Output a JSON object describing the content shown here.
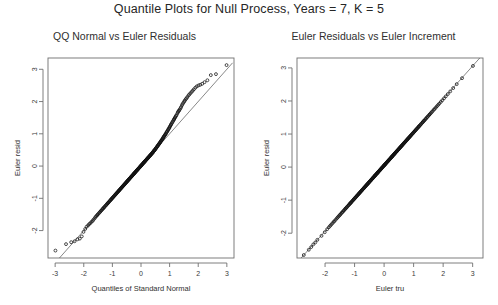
{
  "figure": {
    "title": "Quantile Plots for Null Process, Years = 7, K = 5",
    "background": "#ffffff",
    "point_color": "#111111",
    "line_color": "#555555",
    "axis_color": "#6f6f6f"
  },
  "panels": {
    "left": {
      "title": "QQ Normal vs Euler Residuals"
    },
    "right": {
      "title": "Euler Residuals vs Euler Increment"
    }
  },
  "chart_data": [
    {
      "type": "scatter",
      "title": "QQ Normal vs Euler Residuals",
      "xlabel": "Quantiles of Standard Normal",
      "ylabel": "Euler resid",
      "xlim": [
        -3.25,
        3.25
      ],
      "ylim": [
        -2.85,
        3.35
      ],
      "grid": false,
      "legend": null,
      "xticks": [
        -3,
        -2,
        -1,
        0,
        1,
        2,
        3
      ],
      "yticks": [
        -2,
        -1,
        0,
        1,
        2,
        3
      ],
      "xticklabels": [
        "-3",
        "-2",
        "-1",
        "0",
        "1",
        "2",
        "3"
      ],
      "yticklabels": [
        "-2",
        "-1",
        "0",
        "1",
        "2",
        "3"
      ],
      "reference_line": {
        "slope": 1.0,
        "intercept": 0.0,
        "x_from": -3.1,
        "x_to": 3.2
      },
      "marker": "open-circle",
      "n_points": 300,
      "x": [
        -2.99,
        -2.62,
        -2.44,
        -2.32,
        -2.22,
        -2.14,
        -2.07,
        -2.01,
        -1.95,
        -1.9,
        -1.85,
        -1.81,
        -1.77,
        -1.73,
        -1.69,
        -1.66,
        -1.62,
        -1.59,
        -1.56,
        -1.53,
        -1.51,
        -1.48,
        -1.45,
        -1.43,
        -1.4,
        -1.38,
        -1.35,
        -1.33,
        -1.31,
        -1.29,
        -1.27,
        -1.24,
        -1.22,
        -1.2,
        -1.18,
        -1.16,
        -1.15,
        -1.13,
        -1.11,
        -1.09,
        -1.07,
        -1.05,
        -1.04,
        -1.02,
        -1.0,
        -0.99,
        -0.97,
        -0.95,
        -0.94,
        -0.92,
        -0.9,
        -0.89,
        -0.87,
        -0.86,
        -0.84,
        -0.83,
        -0.81,
        -0.8,
        -0.78,
        -0.77,
        -0.76,
        -0.74,
        -0.73,
        -0.71,
        -0.7,
        -0.69,
        -0.67,
        -0.66,
        -0.65,
        -0.63,
        -0.62,
        -0.61,
        -0.59,
        -0.58,
        -0.57,
        -0.56,
        -0.54,
        -0.53,
        -0.52,
        -0.51,
        -0.49,
        -0.48,
        -0.47,
        -0.46,
        -0.45,
        -0.43,
        -0.42,
        -0.41,
        -0.4,
        -0.39,
        -0.38,
        -0.36,
        -0.35,
        -0.34,
        -0.33,
        -0.32,
        -0.31,
        -0.3,
        -0.28,
        -0.27,
        -0.26,
        -0.25,
        -0.24,
        -0.23,
        -0.22,
        -0.21,
        -0.2,
        -0.18,
        -0.17,
        -0.16,
        -0.15,
        -0.14,
        -0.13,
        -0.12,
        -0.11,
        -0.1,
        -0.09,
        -0.08,
        -0.07,
        -0.05,
        -0.04,
        -0.03,
        -0.02,
        -0.01,
        0.0,
        0.01,
        0.02,
        0.03,
        0.04,
        0.05,
        0.07,
        0.08,
        0.09,
        0.1,
        0.11,
        0.12,
        0.13,
        0.14,
        0.15,
        0.16,
        0.17,
        0.18,
        0.2,
        0.21,
        0.22,
        0.23,
        0.24,
        0.25,
        0.26,
        0.27,
        0.28,
        0.3,
        0.31,
        0.32,
        0.33,
        0.34,
        0.35,
        0.36,
        0.38,
        0.39,
        0.4,
        0.41,
        0.42,
        0.43,
        0.45,
        0.46,
        0.47,
        0.48,
        0.49,
        0.51,
        0.52,
        0.53,
        0.54,
        0.56,
        0.57,
        0.58,
        0.59,
        0.61,
        0.62,
        0.63,
        0.65,
        0.66,
        0.67,
        0.69,
        0.7,
        0.71,
        0.73,
        0.74,
        0.76,
        0.77,
        0.78,
        0.8,
        0.81,
        0.83,
        0.84,
        0.86,
        0.87,
        0.89,
        0.9,
        0.92,
        0.94,
        0.95,
        0.97,
        0.99,
        1.0,
        1.02,
        1.04,
        1.05,
        1.07,
        1.09,
        1.11,
        1.13,
        1.15,
        1.16,
        1.18,
        1.2,
        1.22,
        1.24,
        1.27,
        1.29,
        1.31,
        1.33,
        1.35,
        1.38,
        1.4,
        1.43,
        1.45,
        1.48,
        1.51,
        1.53,
        1.56,
        1.59,
        1.62,
        1.66,
        1.69,
        1.73,
        1.77,
        1.81,
        1.85,
        1.9,
        1.95,
        2.01,
        2.07,
        2.14,
        2.22,
        2.32,
        2.44,
        2.62,
        2.99
      ],
      "y": [
        -2.62,
        -2.42,
        -2.36,
        -2.33,
        -2.27,
        -2.25,
        -2.18,
        -2.04,
        -1.95,
        -1.88,
        -1.84,
        -1.8,
        -1.77,
        -1.73,
        -1.7,
        -1.66,
        -1.62,
        -1.58,
        -1.55,
        -1.52,
        -1.5,
        -1.47,
        -1.44,
        -1.42,
        -1.39,
        -1.37,
        -1.34,
        -1.32,
        -1.3,
        -1.28,
        -1.26,
        -1.23,
        -1.21,
        -1.19,
        -1.17,
        -1.15,
        -1.14,
        -1.12,
        -1.1,
        -1.08,
        -1.06,
        -1.04,
        -1.03,
        -1.01,
        -0.99,
        -0.98,
        -0.96,
        -0.94,
        -0.93,
        -0.91,
        -0.89,
        -0.88,
        -0.86,
        -0.85,
        -0.83,
        -0.82,
        -0.8,
        -0.79,
        -0.77,
        -0.76,
        -0.75,
        -0.73,
        -0.72,
        -0.7,
        -0.69,
        -0.68,
        -0.66,
        -0.65,
        -0.64,
        -0.62,
        -0.61,
        -0.6,
        -0.58,
        -0.57,
        -0.56,
        -0.55,
        -0.53,
        -0.52,
        -0.51,
        -0.5,
        -0.48,
        -0.47,
        -0.46,
        -0.45,
        -0.44,
        -0.42,
        -0.41,
        -0.4,
        -0.39,
        -0.38,
        -0.37,
        -0.35,
        -0.34,
        -0.33,
        -0.32,
        -0.31,
        -0.3,
        -0.29,
        -0.27,
        -0.26,
        -0.25,
        -0.24,
        -0.23,
        -0.22,
        -0.21,
        -0.2,
        -0.19,
        -0.17,
        -0.16,
        -0.15,
        -0.14,
        -0.13,
        -0.12,
        -0.11,
        -0.1,
        -0.09,
        -0.08,
        -0.07,
        -0.06,
        -0.04,
        -0.03,
        -0.02,
        -0.01,
        0.0,
        0.01,
        0.02,
        0.03,
        0.04,
        0.05,
        0.06,
        0.08,
        0.09,
        0.1,
        0.11,
        0.12,
        0.13,
        0.14,
        0.15,
        0.16,
        0.17,
        0.18,
        0.19,
        0.21,
        0.22,
        0.23,
        0.24,
        0.25,
        0.26,
        0.27,
        0.28,
        0.29,
        0.31,
        0.32,
        0.33,
        0.34,
        0.35,
        0.36,
        0.37,
        0.39,
        0.4,
        0.41,
        0.42,
        0.43,
        0.45,
        0.47,
        0.48,
        0.49,
        0.5,
        0.51,
        0.54,
        0.55,
        0.56,
        0.57,
        0.6,
        0.61,
        0.62,
        0.64,
        0.66,
        0.67,
        0.69,
        0.71,
        0.72,
        0.74,
        0.76,
        0.78,
        0.79,
        0.81,
        0.83,
        0.85,
        0.87,
        0.89,
        0.91,
        0.93,
        0.95,
        0.97,
        0.99,
        1.01,
        1.04,
        1.06,
        1.08,
        1.11,
        1.13,
        1.16,
        1.18,
        1.21,
        1.24,
        1.27,
        1.29,
        1.32,
        1.35,
        1.38,
        1.41,
        1.44,
        1.46,
        1.49,
        1.52,
        1.55,
        1.58,
        1.63,
        1.67,
        1.7,
        1.72,
        1.75,
        1.79,
        1.83,
        1.88,
        1.92,
        1.96,
        2.0,
        2.03,
        2.07,
        2.1,
        2.14,
        2.19,
        2.22,
        2.26,
        2.3,
        2.34,
        2.38,
        2.43,
        2.47,
        2.5,
        2.52,
        2.55,
        2.6,
        2.66,
        2.82,
        2.85,
        3.13
      ]
    },
    {
      "type": "scatter",
      "title": "Euler Residuals vs Euler Increment",
      "xlabel": "Euler tru",
      "ylabel": "Euler resid",
      "xlim": [
        -2.95,
        3.35
      ],
      "ylim": [
        -2.75,
        3.3
      ],
      "grid": false,
      "legend": null,
      "xticks": [
        -2,
        -1,
        0,
        1,
        2,
        3
      ],
      "yticks": [
        -2,
        -1,
        0,
        1,
        2,
        3
      ],
      "xticklabels": [
        "-2",
        "-1",
        "0",
        "1",
        "2",
        "3"
      ],
      "yticklabels": [
        "-2",
        "-1",
        "0",
        "1",
        "2",
        "3"
      ],
      "reference_line": {
        "slope": 1.0,
        "intercept": 0.06,
        "x_from": -2.85,
        "x_to": 3.25
      },
      "marker": "open-circle",
      "n_points": 300,
      "x": [
        -2.72,
        -2.55,
        -2.47,
        -2.4,
        -2.33,
        -2.26,
        -2.12,
        -2.01,
        -1.93,
        -1.87,
        -1.83,
        -1.79,
        -1.75,
        -1.71,
        -1.68,
        -1.64,
        -1.6,
        -1.57,
        -1.54,
        -1.51,
        -1.49,
        -1.46,
        -1.43,
        -1.41,
        -1.38,
        -1.36,
        -1.33,
        -1.31,
        -1.29,
        -1.27,
        -1.25,
        -1.22,
        -1.2,
        -1.18,
        -1.16,
        -1.14,
        -1.13,
        -1.11,
        -1.09,
        -1.07,
        -1.05,
        -1.03,
        -1.02,
        -1.0,
        -0.98,
        -0.97,
        -0.95,
        -0.93,
        -0.92,
        -0.9,
        -0.88,
        -0.87,
        -0.85,
        -0.84,
        -0.82,
        -0.81,
        -0.79,
        -0.78,
        -0.76,
        -0.75,
        -0.74,
        -0.72,
        -0.71,
        -0.69,
        -0.68,
        -0.67,
        -0.65,
        -0.64,
        -0.63,
        -0.61,
        -0.6,
        -0.59,
        -0.57,
        -0.56,
        -0.55,
        -0.54,
        -0.52,
        -0.51,
        -0.5,
        -0.49,
        -0.47,
        -0.46,
        -0.45,
        -0.44,
        -0.43,
        -0.41,
        -0.4,
        -0.39,
        -0.38,
        -0.37,
        -0.36,
        -0.34,
        -0.33,
        -0.32,
        -0.31,
        -0.3,
        -0.29,
        -0.28,
        -0.26,
        -0.25,
        -0.24,
        -0.23,
        -0.22,
        -0.21,
        -0.2,
        -0.19,
        -0.18,
        -0.16,
        -0.15,
        -0.14,
        -0.13,
        -0.12,
        -0.11,
        -0.1,
        -0.09,
        -0.08,
        -0.07,
        -0.06,
        -0.05,
        -0.03,
        -0.02,
        -0.01,
        0.0,
        0.01,
        0.02,
        0.03,
        0.04,
        0.05,
        0.06,
        0.07,
        0.09,
        0.1,
        0.11,
        0.12,
        0.13,
        0.14,
        0.15,
        0.16,
        0.17,
        0.18,
        0.19,
        0.2,
        0.22,
        0.23,
        0.24,
        0.25,
        0.26,
        0.27,
        0.28,
        0.29,
        0.3,
        0.32,
        0.33,
        0.34,
        0.35,
        0.36,
        0.37,
        0.38,
        0.4,
        0.41,
        0.42,
        0.43,
        0.44,
        0.45,
        0.47,
        0.48,
        0.49,
        0.5,
        0.51,
        0.53,
        0.54,
        0.55,
        0.56,
        0.58,
        0.59,
        0.6,
        0.61,
        0.63,
        0.64,
        0.65,
        0.67,
        0.68,
        0.69,
        0.71,
        0.72,
        0.73,
        0.75,
        0.76,
        0.78,
        0.79,
        0.8,
        0.82,
        0.83,
        0.85,
        0.86,
        0.88,
        0.89,
        0.91,
        0.92,
        0.94,
        0.96,
        0.97,
        0.99,
        1.01,
        1.02,
        1.04,
        1.06,
        1.07,
        1.09,
        1.11,
        1.13,
        1.15,
        1.17,
        1.18,
        1.2,
        1.22,
        1.24,
        1.26,
        1.29,
        1.31,
        1.33,
        1.35,
        1.37,
        1.4,
        1.42,
        1.45,
        1.47,
        1.5,
        1.53,
        1.55,
        1.58,
        1.61,
        1.64,
        1.68,
        1.71,
        1.75,
        1.79,
        1.83,
        1.87,
        1.92,
        1.97,
        2.03,
        2.09,
        2.16,
        2.24,
        2.34,
        2.46,
        2.64,
        3.01
      ],
      "y": [
        -2.66,
        -2.5,
        -2.42,
        -2.34,
        -2.28,
        -2.2,
        -2.08,
        -1.97,
        -1.88,
        -1.82,
        -1.78,
        -1.74,
        -1.7,
        -1.66,
        -1.63,
        -1.59,
        -1.55,
        -1.52,
        -1.49,
        -1.46,
        -1.44,
        -1.41,
        -1.38,
        -1.36,
        -1.33,
        -1.31,
        -1.28,
        -1.26,
        -1.24,
        -1.22,
        -1.2,
        -1.17,
        -1.15,
        -1.13,
        -1.11,
        -1.09,
        -1.08,
        -1.06,
        -1.04,
        -1.02,
        -1.0,
        -0.98,
        -0.97,
        -0.95,
        -0.93,
        -0.92,
        -0.9,
        -0.88,
        -0.87,
        -0.85,
        -0.83,
        -0.82,
        -0.8,
        -0.79,
        -0.77,
        -0.76,
        -0.74,
        -0.73,
        -0.71,
        -0.7,
        -0.69,
        -0.67,
        -0.66,
        -0.64,
        -0.63,
        -0.62,
        -0.6,
        -0.59,
        -0.58,
        -0.56,
        -0.55,
        -0.54,
        -0.52,
        -0.51,
        -0.5,
        -0.49,
        -0.47,
        -0.46,
        -0.45,
        -0.44,
        -0.42,
        -0.41,
        -0.4,
        -0.39,
        -0.38,
        -0.36,
        -0.35,
        -0.34,
        -0.33,
        -0.32,
        -0.31,
        -0.29,
        -0.28,
        -0.27,
        -0.26,
        -0.25,
        -0.24,
        -0.23,
        -0.21,
        -0.2,
        -0.19,
        -0.18,
        -0.17,
        -0.16,
        -0.15,
        -0.14,
        -0.13,
        -0.11,
        -0.1,
        -0.09,
        -0.08,
        -0.07,
        -0.06,
        -0.05,
        -0.04,
        -0.03,
        -0.02,
        -0.01,
        0.0,
        0.02,
        0.03,
        0.04,
        0.05,
        0.06,
        0.07,
        0.08,
        0.09,
        0.1,
        0.11,
        0.12,
        0.14,
        0.15,
        0.16,
        0.17,
        0.18,
        0.19,
        0.2,
        0.21,
        0.22,
        0.23,
        0.24,
        0.25,
        0.27,
        0.28,
        0.29,
        0.3,
        0.31,
        0.32,
        0.33,
        0.34,
        0.35,
        0.37,
        0.38,
        0.39,
        0.4,
        0.41,
        0.42,
        0.43,
        0.45,
        0.46,
        0.47,
        0.48,
        0.49,
        0.5,
        0.52,
        0.53,
        0.54,
        0.55,
        0.56,
        0.58,
        0.59,
        0.6,
        0.61,
        0.63,
        0.64,
        0.65,
        0.66,
        0.68,
        0.69,
        0.7,
        0.72,
        0.73,
        0.74,
        0.76,
        0.77,
        0.78,
        0.8,
        0.81,
        0.83,
        0.84,
        0.85,
        0.87,
        0.88,
        0.9,
        0.91,
        0.93,
        0.94,
        0.96,
        0.97,
        0.99,
        1.01,
        1.02,
        1.04,
        1.06,
        1.07,
        1.09,
        1.11,
        1.12,
        1.14,
        1.16,
        1.18,
        1.2,
        1.22,
        1.23,
        1.25,
        1.27,
        1.29,
        1.31,
        1.34,
        1.36,
        1.38,
        1.4,
        1.42,
        1.45,
        1.47,
        1.5,
        1.52,
        1.55,
        1.58,
        1.6,
        1.63,
        1.66,
        1.69,
        1.73,
        1.76,
        1.8,
        1.84,
        1.88,
        1.92,
        1.97,
        2.02,
        2.08,
        2.14,
        2.21,
        2.29,
        2.39,
        2.51,
        2.69,
        3.06
      ]
    }
  ]
}
